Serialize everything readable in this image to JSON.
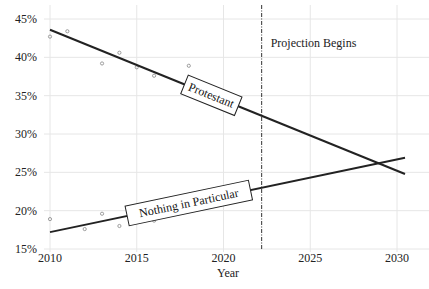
{
  "chart_data": {
    "type": "line",
    "title": "",
    "xlabel": "Year",
    "ylabel": "",
    "xlim": [
      2010,
      2030
    ],
    "ylim": [
      15,
      45
    ],
    "x_ticks": [
      "2010",
      "2015",
      "2020",
      "2025",
      "2030"
    ],
    "y_ticks": [
      "15%",
      "20%",
      "25%",
      "30%",
      "35%",
      "40%",
      "45%"
    ],
    "grid": true,
    "legend": "inline labels on lines",
    "annotations": [
      {
        "text": "Projection Begins",
        "x": 2022.2,
        "type": "vertical-dashdot-line"
      }
    ],
    "series": [
      {
        "name": "Protestant",
        "points": [
          {
            "x": 2010,
            "y": 42.7
          },
          {
            "x": 2011,
            "y": 43.4
          },
          {
            "x": 2013,
            "y": 39.2
          },
          {
            "x": 2014,
            "y": 40.6
          },
          {
            "x": 2015,
            "y": 38.7
          },
          {
            "x": 2016,
            "y": 37.6
          },
          {
            "x": 2018,
            "y": 38.9
          }
        ],
        "trend": {
          "x": [
            2010,
            2030
          ],
          "y": [
            43.6,
            25.2
          ]
        }
      },
      {
        "name": "Nothing in Particular",
        "points": [
          {
            "x": 2010,
            "y": 18.9
          },
          {
            "x": 2012,
            "y": 17.6
          },
          {
            "x": 2013,
            "y": 19.6
          },
          {
            "x": 2014,
            "y": 18.0
          },
          {
            "x": 2015,
            "y": 19.8
          },
          {
            "x": 2016,
            "y": 18.7
          },
          {
            "x": 2017,
            "y": 19.8
          }
        ],
        "trend": {
          "x": [
            2010,
            2030
          ],
          "y": [
            17.2,
            26.7
          ]
        }
      }
    ]
  }
}
